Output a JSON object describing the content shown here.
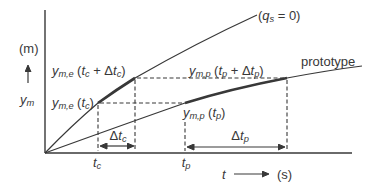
{
  "figure": {
    "background_color": "#ffffff",
    "ink_color": "#383838",
    "y_axis": {
      "unit": "(m)",
      "symbol": "y",
      "symbol_sub": "m"
    },
    "x_axis": {
      "symbol": "t",
      "unit": "(s)"
    },
    "curve_labels": {
      "model": {
        "open": "(",
        "var": "q",
        "sub": "s",
        "rest": " = 0)"
      },
      "prototype": "prototype"
    },
    "point_labels": {
      "ym_e_tc_dtc": {
        "var": "y",
        "varsub": "m,e",
        "open": " (",
        "t1": "t",
        "t1sub": "c",
        "plus": " + Δ",
        "t2": "t",
        "t2sub": "c",
        "close": ")"
      },
      "ym_e_tc": {
        "var": "y",
        "varsub": "m,e",
        "open": " (",
        "t1": "t",
        "t1sub": "c",
        "close": ")"
      },
      "ym_p_tp_dtp": {
        "var": "y",
        "varsub": "m,p",
        "open": " (",
        "t1": "t",
        "t1sub": "p",
        "plus": " + Δ",
        "t2": "t",
        "t2sub": "p",
        "close": ")"
      },
      "ym_p_tp": {
        "var": "y",
        "varsub": "m,p",
        "open": " (",
        "t1": "t",
        "t1sub": "p",
        "close": ")"
      }
    },
    "interval_labels": {
      "delta_tc": {
        "delta": "Δ",
        "var": "t",
        "sub": "c"
      },
      "delta_tp": {
        "delta": "Δ",
        "var": "t",
        "sub": "p"
      }
    },
    "tick_labels": {
      "tc": {
        "var": "t",
        "sub": "c"
      },
      "tp": {
        "var": "t",
        "sub": "p"
      }
    }
  }
}
